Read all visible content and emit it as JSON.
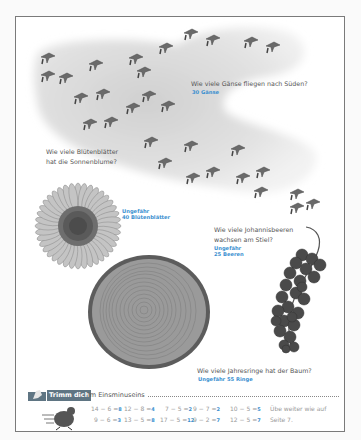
{
  "geese": {
    "question": "Wie viele Gänse fliegen nach Süden?",
    "answer": "30 Gänse"
  },
  "sunflower": {
    "question_line1": "Wie viele Blütenblätter",
    "question_line2": "hat die Sonnenblume?",
    "answer_line1": "Ungefähr",
    "answer_line2": "40 Blütenblätter"
  },
  "currants": {
    "question_line1": "Wie viele Johannisbeeren",
    "question_line2": "wachsen am Stiel?",
    "answer_line1": "Ungefähr",
    "answer_line2": "25 Beeren"
  },
  "tree": {
    "question": "Wie viele Jahresringe hat der Baum?",
    "answer": "Ungefähr 55 Ringe"
  },
  "trimm": {
    "badge": "Trimm dich",
    "title_rest": "im Einsminuseins",
    "equations_row1": [
      {
        "expr": "14 − 6 =",
        "result": "8"
      },
      {
        "expr": "12 − 8 =",
        "result": "4"
      },
      {
        "expr": "7 − 5 =",
        "result": "2"
      },
      {
        "expr": "9 − 7 =",
        "result": "2"
      },
      {
        "expr": "10 − 5 =",
        "result": "5"
      }
    ],
    "equations_row2": [
      {
        "expr": "9 − 6 =",
        "result": "3"
      },
      {
        "expr": "13 − 5 =",
        "result": "8"
      },
      {
        "expr": "17 − 5 =",
        "result": "12"
      },
      {
        "expr": "9 − 2 =",
        "result": "7"
      },
      {
        "expr": "12 − 5 =",
        "result": "7"
      }
    ],
    "note_line1": "Übe weiter wie auf",
    "note_line2": "Seite 7."
  },
  "colors": {
    "answer_blue": "#3a8fd0",
    "badge_gray": "#5f7583",
    "frame_border": "#7a7a7a"
  }
}
